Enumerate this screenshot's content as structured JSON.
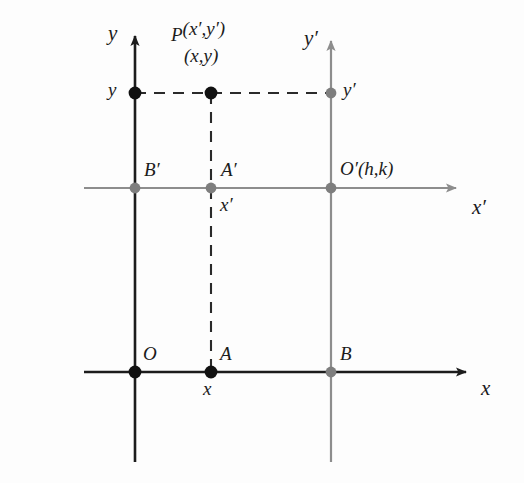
{
  "figure": {
    "colors": {
      "primary_line": "#1c1c1c",
      "secondary_line": "#8d8d8d",
      "point_primary": "#111111",
      "point_secondary": "#7e7e7e",
      "background": "#fdfdfd",
      "text": "#1b1b1b"
    }
  },
  "axes": [
    {
      "id": "y-axis",
      "label": "y",
      "orientation": "vertical",
      "style": "solid",
      "color": "primary"
    },
    {
      "id": "x-axis",
      "label": "x",
      "orientation": "horizontal",
      "style": "solid",
      "color": "primary"
    },
    {
      "id": "y-prime-axis",
      "label": "y′",
      "orientation": "vertical",
      "style": "solid",
      "color": "secondary"
    },
    {
      "id": "x-prime-axis",
      "label": "x′",
      "orientation": "horizontal",
      "style": "solid",
      "color": "secondary"
    }
  ],
  "points": [
    {
      "id": "point-O",
      "label": "O",
      "x": 135,
      "y": 372,
      "filled": "black"
    },
    {
      "id": "point-A",
      "label": "A",
      "x": 211,
      "y": 372,
      "filled": "black"
    },
    {
      "id": "point-B",
      "label": "B",
      "x": 331,
      "y": 372,
      "filled": "gray"
    },
    {
      "id": "point-B-prime",
      "label": "B′",
      "x": 135,
      "y": 188,
      "filled": "gray"
    },
    {
      "id": "point-A-prime",
      "label": "A′",
      "x": 211,
      "y": 188,
      "filled": "gray"
    },
    {
      "id": "point-O-prime",
      "label": "O′(h,k)",
      "x": 331,
      "y": 188,
      "filled": "gray"
    },
    {
      "id": "point-y",
      "label": "y",
      "x": 135,
      "y": 93,
      "filled": "black"
    },
    {
      "id": "point-P",
      "label": "P",
      "x": 211,
      "y": 93,
      "filled": "black"
    },
    {
      "id": "point-y-prime",
      "label": "y′",
      "x": 331,
      "y": 93,
      "filled": "gray"
    }
  ],
  "labels": {
    "axis_y": "y",
    "axis_x": "x",
    "axis_y_prime": "y′",
    "axis_x_prime": "x′",
    "point_O": "O",
    "point_A": "A",
    "point_B": "B",
    "point_B_prime": "B′",
    "point_A_prime": "A′",
    "point_O_prime": "O′(h,k)",
    "tick_y": "y",
    "tick_y_prime": "y′",
    "tick_x": "x",
    "tick_x_prime": "x′",
    "point_P_name": "P",
    "point_P_coords_primed": "(x′,y′)",
    "point_P_coords_plain": "(x,y)"
  },
  "dashed_paths": [
    {
      "id": "dash-horizontal-y-to-yprime",
      "from": "point-y",
      "to": "point-y-prime",
      "through": "point-P"
    },
    {
      "id": "dash-vertical-P-to-A",
      "from": "point-P",
      "to": "point-A",
      "through": "point-A-prime"
    }
  ]
}
